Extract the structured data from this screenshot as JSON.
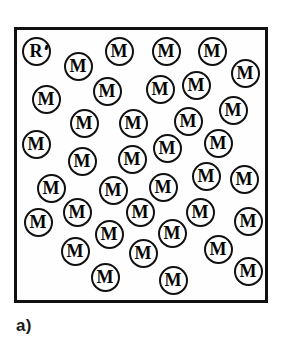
{
  "figure": {
    "caption": "a)",
    "clipped_header_text": "",
    "colors": {
      "ink": "#111111",
      "background": "#ffffff",
      "caption": "#1a1a1a"
    },
    "vessel": {
      "name": "reaction-vessel",
      "x": 14,
      "y": 27,
      "width": 254,
      "height": 276,
      "border_width": 3
    },
    "legend": {
      "monomer_label": "M",
      "radical_label": "R"
    },
    "counts": {
      "monomer": 40,
      "radical": 1,
      "total": 41
    },
    "particles": [
      {
        "label": "R",
        "kind": "radical",
        "cx": 36,
        "cy": 51,
        "d": 29
      },
      {
        "label": "M",
        "kind": "monomer",
        "cx": 78,
        "cy": 66,
        "d": 29
      },
      {
        "label": "M",
        "kind": "monomer",
        "cx": 119,
        "cy": 51,
        "d": 29
      },
      {
        "label": "M",
        "kind": "monomer",
        "cx": 166,
        "cy": 51,
        "d": 29
      },
      {
        "label": "M",
        "kind": "monomer",
        "cx": 212,
        "cy": 51,
        "d": 29
      },
      {
        "label": "M",
        "kind": "monomer",
        "cx": 245,
        "cy": 73,
        "d": 29
      },
      {
        "label": "M",
        "kind": "monomer",
        "cx": 46,
        "cy": 99,
        "d": 29
      },
      {
        "label": "M",
        "kind": "monomer",
        "cx": 107,
        "cy": 91,
        "d": 29
      },
      {
        "label": "M",
        "kind": "monomer",
        "cx": 160,
        "cy": 89,
        "d": 29
      },
      {
        "label": "M",
        "kind": "monomer",
        "cx": 196,
        "cy": 85,
        "d": 29
      },
      {
        "label": "M",
        "kind": "monomer",
        "cx": 233,
        "cy": 110,
        "d": 29
      },
      {
        "label": "M",
        "kind": "monomer",
        "cx": 84,
        "cy": 123,
        "d": 29
      },
      {
        "label": "M",
        "kind": "monomer",
        "cx": 133,
        "cy": 123,
        "d": 29
      },
      {
        "label": "M",
        "kind": "monomer",
        "cx": 188,
        "cy": 121,
        "d": 29
      },
      {
        "label": "M",
        "kind": "monomer",
        "cx": 218,
        "cy": 143,
        "d": 29
      },
      {
        "label": "M",
        "kind": "monomer",
        "cx": 36,
        "cy": 144,
        "d": 29
      },
      {
        "label": "M",
        "kind": "monomer",
        "cx": 82,
        "cy": 161,
        "d": 29
      },
      {
        "label": "M",
        "kind": "monomer",
        "cx": 132,
        "cy": 159,
        "d": 29
      },
      {
        "label": "M",
        "kind": "monomer",
        "cx": 167,
        "cy": 148,
        "d": 29
      },
      {
        "label": "M",
        "kind": "monomer",
        "cx": 51,
        "cy": 188,
        "d": 29
      },
      {
        "label": "M",
        "kind": "monomer",
        "cx": 113,
        "cy": 190,
        "d": 29
      },
      {
        "label": "M",
        "kind": "monomer",
        "cx": 163,
        "cy": 187,
        "d": 29
      },
      {
        "label": "M",
        "kind": "monomer",
        "cx": 206,
        "cy": 176,
        "d": 29
      },
      {
        "label": "M",
        "kind": "monomer",
        "cx": 244,
        "cy": 179,
        "d": 29
      },
      {
        "label": "M",
        "kind": "monomer",
        "cx": 77,
        "cy": 212,
        "d": 29
      },
      {
        "label": "M",
        "kind": "monomer",
        "cx": 140,
        "cy": 212,
        "d": 29
      },
      {
        "label": "M",
        "kind": "monomer",
        "cx": 200,
        "cy": 212,
        "d": 29
      },
      {
        "label": "M",
        "kind": "monomer",
        "cx": 248,
        "cy": 221,
        "d": 29
      },
      {
        "label": "M",
        "kind": "monomer",
        "cx": 38,
        "cy": 222,
        "d": 29
      },
      {
        "label": "M",
        "kind": "monomer",
        "cx": 109,
        "cy": 234,
        "d": 29
      },
      {
        "label": "M",
        "kind": "monomer",
        "cx": 172,
        "cy": 233,
        "d": 29
      },
      {
        "label": "M",
        "kind": "monomer",
        "cx": 218,
        "cy": 249,
        "d": 29
      },
      {
        "label": "M",
        "kind": "monomer",
        "cx": 75,
        "cy": 251,
        "d": 29
      },
      {
        "label": "M",
        "kind": "monomer",
        "cx": 143,
        "cy": 253,
        "d": 29
      },
      {
        "label": "M",
        "kind": "monomer",
        "cx": 105,
        "cy": 277,
        "d": 29
      },
      {
        "label": "M",
        "kind": "monomer",
        "cx": 173,
        "cy": 280,
        "d": 29
      },
      {
        "label": "M",
        "kind": "monomer",
        "cx": 248,
        "cy": 271,
        "d": 29
      }
    ]
  }
}
